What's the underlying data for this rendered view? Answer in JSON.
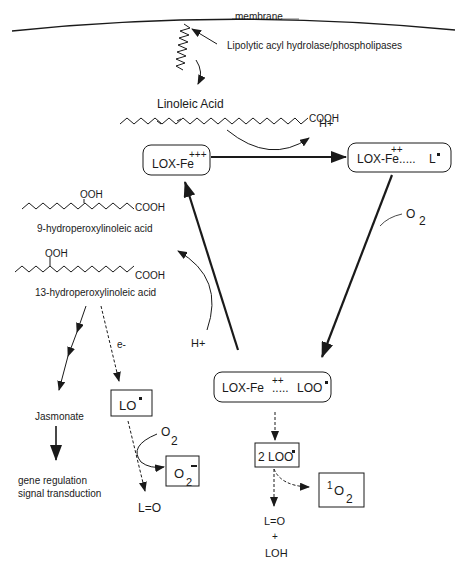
{
  "diagram": {
    "membrane_label": "membrane",
    "enzyme_label": "Lipolytic acyl hydrolase/phospholipases",
    "substrate_label": "Linoleic Acid",
    "cooh": "COOH",
    "ooh": "OOH",
    "h_plus_top": "H+",
    "h_plus_left": "H+",
    "lox_fe3": {
      "label": "LOX-Fe",
      "charge": "+++"
    },
    "lox_fe2_l": {
      "label": "LOX-Fe",
      "charge": "++",
      "dots": ".....",
      "radical": "L"
    },
    "lox_fe2_loo": {
      "label": "LOX-Fe",
      "charge": "++",
      "dots": ".....",
      "radical": "LOO"
    },
    "o2_right": {
      "o": "O",
      "sub": "2"
    },
    "hpod9_label": "9-hydroperoxylinoleic acid",
    "hpod13_label": "13-hydroperoxylinoleic acid",
    "electron_label": "e-",
    "lo_radical": "LO",
    "o2_lo": {
      "o": "O",
      "sub": "2"
    },
    "superoxide": {
      "o": "O",
      "sub": "2",
      "charge": "-"
    },
    "lo_product": "L=O",
    "jasmonate": "Jasmonate",
    "gene_regulation": "gene regulation",
    "signal_transduction": "signal transduction",
    "two_loo": "2 LOO",
    "singlet_o2": {
      "sup": "1",
      "o": "O",
      "sub": "2"
    },
    "final_lo": "L=O",
    "final_plus": "+",
    "final_loh": "LOH"
  }
}
